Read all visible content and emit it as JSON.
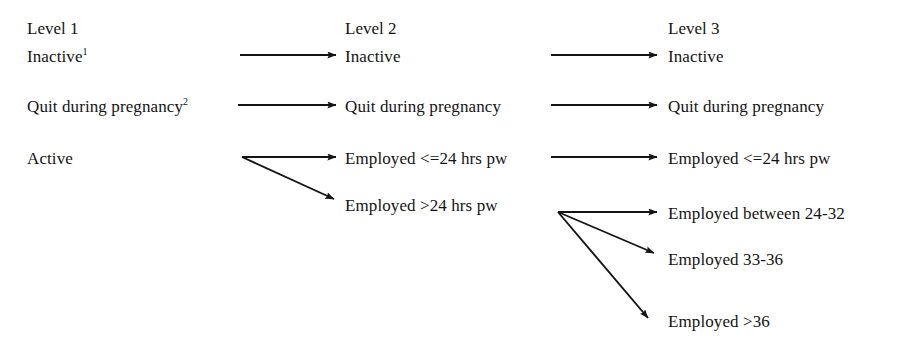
{
  "figure": {
    "background_color": "#ffffff",
    "ink_color": "#141414"
  },
  "columns": [
    {
      "id": "level-1",
      "header": "Level 1",
      "x": 27,
      "header_y": 20
    },
    {
      "id": "level-2",
      "header": "Level 2",
      "x": 345,
      "header_y": 20
    },
    {
      "id": "level-3",
      "header": "Level 3",
      "x": 668,
      "header_y": 20
    }
  ],
  "nodes": {
    "l1_inactive": {
      "label": "Inactive",
      "superscript": "1",
      "x": 27,
      "y": 55
    },
    "l1_quit": {
      "label": "Quit during pregnancy",
      "superscript": "2",
      "x": 27,
      "y": 105
    },
    "l1_active": {
      "label": "Active",
      "superscript": "",
      "x": 27,
      "y": 157
    },
    "l2_inactive": {
      "label": "Inactive",
      "superscript": "",
      "x": 345,
      "y": 55
    },
    "l2_quit": {
      "label": "Quit during pregnancy",
      "superscript": "",
      "x": 345,
      "y": 105
    },
    "l2_emp_le24": {
      "label": "Employed <=24 hrs pw",
      "superscript": "",
      "x": 345,
      "y": 157
    },
    "l2_emp_gt24": {
      "label": "Employed >24 hrs pw",
      "superscript": "",
      "x": 345,
      "y": 204
    },
    "l3_inactive": {
      "label": "Inactive",
      "superscript": "",
      "x": 668,
      "y": 55
    },
    "l3_quit": {
      "label": "Quit during pregnancy",
      "superscript": "",
      "x": 668,
      "y": 105
    },
    "l3_emp_le24": {
      "label": "Employed <=24 hrs pw",
      "superscript": "",
      "x": 668,
      "y": 157
    },
    "l3_emp_24_32": {
      "label": "Employed between 24-32",
      "superscript": "",
      "x": 668,
      "y": 212
    },
    "l3_emp_33_36": {
      "label": "Employed 33-36",
      "superscript": "",
      "x": 668,
      "y": 258
    },
    "l3_emp_gt36": {
      "label": "Employed >36",
      "superscript": "",
      "x": 668,
      "y": 320
    }
  },
  "edges": [
    {
      "id": "e-l1-inactive-to-l2-inactive",
      "from": "l1_inactive",
      "to": "l2_inactive",
      "x1": 240,
      "y1": 55,
      "x2": 336,
      "y2": 55
    },
    {
      "id": "e-l1-quit-to-l2-quit",
      "from": "l1_quit",
      "to": "l2_quit",
      "x1": 238,
      "y1": 105,
      "x2": 336,
      "y2": 105
    },
    {
      "id": "e-l1-active-to-l2-emp-le24",
      "from": "l1_active",
      "to": "l2_emp_le24",
      "x1": 242,
      "y1": 157,
      "x2": 336,
      "y2": 157
    },
    {
      "id": "e-l1-active-to-l2-emp-gt24",
      "from": "l1_active",
      "to": "l2_emp_gt24",
      "x1": 242,
      "y1": 157,
      "x2": 334,
      "y2": 199
    },
    {
      "id": "e-l2-inactive-to-l3-inactive",
      "from": "l2_inactive",
      "to": "l3_inactive",
      "x1": 551,
      "y1": 55,
      "x2": 657,
      "y2": 55
    },
    {
      "id": "e-l2-quit-to-l3-quit",
      "from": "l2_quit",
      "to": "l3_quit",
      "x1": 551,
      "y1": 105,
      "x2": 657,
      "y2": 105
    },
    {
      "id": "e-l2-emp-le24-to-l3-emp-le24",
      "from": "l2_emp_le24",
      "to": "l3_emp_le24",
      "x1": 551,
      "y1": 157,
      "x2": 657,
      "y2": 157
    },
    {
      "id": "e-l2-emp-gt24-to-l3-emp-24-32",
      "from": "l2_emp_gt24",
      "to": "l3_emp_24_32",
      "x1": 558,
      "y1": 212,
      "x2": 657,
      "y2": 212
    },
    {
      "id": "e-l2-emp-gt24-to-l3-emp-33-36",
      "from": "l2_emp_gt24",
      "to": "l3_emp_33_36",
      "x1": 558,
      "y1": 212,
      "x2": 654,
      "y2": 253
    },
    {
      "id": "e-l2-emp-gt24-to-l3-emp-gt36",
      "from": "l2_emp_gt24",
      "to": "l3_emp_gt36",
      "x1": 558,
      "y1": 212,
      "x2": 648,
      "y2": 318
    }
  ],
  "footnote_markers": [
    "1",
    "2"
  ]
}
